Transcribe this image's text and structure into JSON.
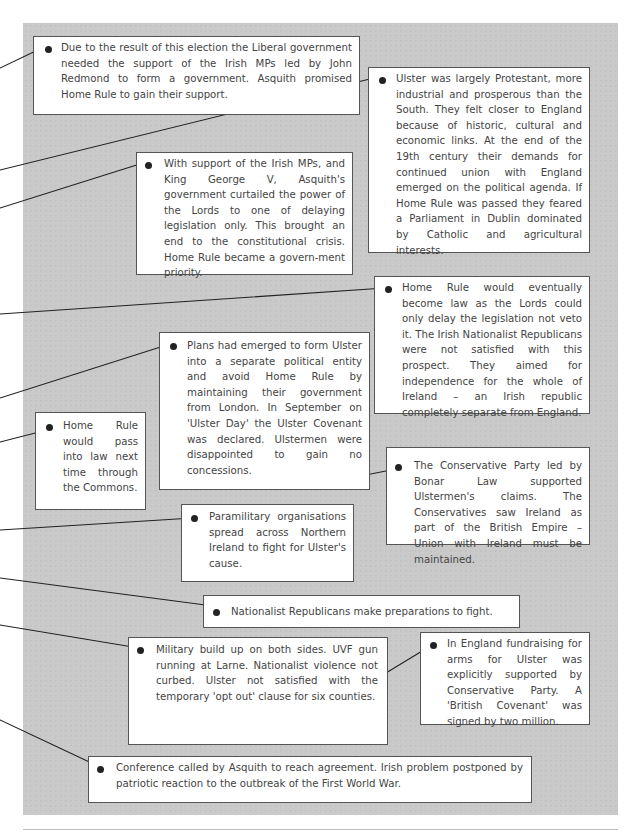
{
  "panel": {
    "background": "#c9c9c9",
    "box_border": "#555555",
    "text_color": "#444444",
    "bullet_color": "#222222"
  },
  "boxes": [
    {
      "id": "election-result",
      "text": "Due to the result of this election the Liberal government needed the support of the Irish MPs led by John Redmond to form a government. Asquith promised Home Rule to gain their support."
    },
    {
      "id": "ulster-protestant",
      "text": "Ulster was largely Protestant, more industrial and prosperous than the South. They felt closer to England because of historic, cultural and economic links. At the end of the 19th century their demands for continued union with England emerged on the political agenda. If Home Rule was passed they feared a Parliament in Dublin dominated by Catholic and agricultural interests."
    },
    {
      "id": "lords-curtailed",
      "text": "With support of the Irish MPs, and King George V, Asquith's government curtailed the power of the Lords to one of delaying legislation only. This brought an end to the constitutional crisis. Home Rule became a govern-ment priority."
    },
    {
      "id": "home-rule-eventually",
      "text": "Home Rule would eventually become law as the Lords could only delay the legislation not veto it. The Irish Nationalist Republicans were not satisfied with this prospect. They aimed for independence for the whole of Ireland – an Irish republic completely separate from England."
    },
    {
      "id": "ulster-plans",
      "text": "Plans had emerged to form Ulster into a separate political entity and avoid Home Rule by maintaining their government from London. In September on 'Ulster Day' the Ulster Covenant was declared. Ulstermen were disappointed to gain no concessions."
    },
    {
      "id": "home-rule-commons",
      "text": "Home Rule would pass into law next time through the Commons."
    },
    {
      "id": "conservative-party",
      "text": "The Conservative Party led by Bonar Law supported Ulstermen's claims. The Conservatives saw Ireland as part of the British Empire – Union with Ireland must be maintained."
    },
    {
      "id": "paramilitary",
      "text": "Paramilitary organisations spread across Northern Ireland to fight for Ulster's cause."
    },
    {
      "id": "nationalist-preparations",
      "text": "Nationalist Republicans make preparations to fight."
    },
    {
      "id": "military-buildup",
      "text": "Military build up on both sides. UVF gun running at Larne. Nationalist violence not curbed. Ulster not satisfied with the temporary 'opt out' clause for six counties."
    },
    {
      "id": "england-fundraising",
      "text": "In England fundraising for arms for Ulster was explicitly supported by Conservative Party. A 'British Covenant' was signed by two million."
    },
    {
      "id": "conference",
      "text": "Conference called by Asquith to reach agreement. Irish problem postponed by patriotic reaction to the outbreak of the First World War."
    }
  ]
}
